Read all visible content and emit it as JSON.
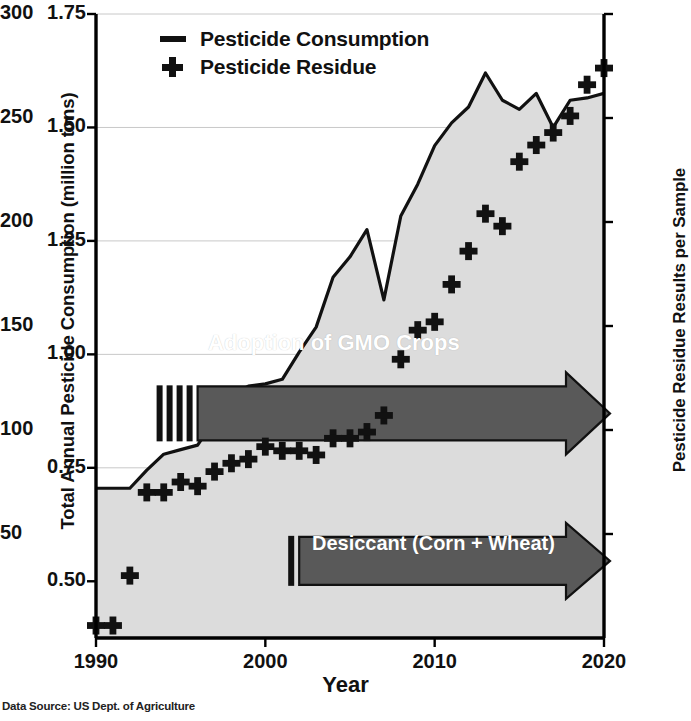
{
  "chart_data": {
    "type": "line",
    "title": "",
    "xlabel": "Year",
    "ylabel": "Total Annual Pesticide Consumption (million tons)",
    "ylabel_right": "Pesticide Residue Results per Sample",
    "xlim": [
      1990,
      2020
    ],
    "ylim": [
      0.375,
      1.75
    ],
    "ylim_right": [
      0,
      300
    ],
    "xticks": [
      "1990",
      "2000",
      "2010",
      "2020"
    ],
    "yticks_left": [
      "0.50",
      "0.75",
      "1.00",
      "1.25",
      "1.50",
      "1.75"
    ],
    "yticks_right": [
      "50",
      "100",
      "150",
      "200",
      "250",
      "300"
    ],
    "grid": true,
    "legend_position": "top-left",
    "source_note": "Data Source: US Dept. of Agriculture",
    "series": [
      {
        "name": "Pesticide Consumption",
        "type": "area-line",
        "axis": "left",
        "unit": "million tons",
        "x": [
          1990,
          1991,
          1992,
          1993,
          1994,
          1995,
          1996,
          1997,
          1998,
          1999,
          2000,
          2001,
          2002,
          2003,
          2004,
          2005,
          2006,
          2007,
          2008,
          2009,
          2010,
          2011,
          2012,
          2013,
          2014,
          2015,
          2016,
          2017,
          2018,
          2019,
          2020
        ],
        "values": [
          0.705,
          0.705,
          0.705,
          0.745,
          0.78,
          0.79,
          0.8,
          0.855,
          0.91,
          0.93,
          0.935,
          0.945,
          1.005,
          1.06,
          1.17,
          1.215,
          1.275,
          1.12,
          1.305,
          1.375,
          1.46,
          1.51,
          1.545,
          1.62,
          1.56,
          1.54,
          1.575,
          1.5,
          1.56,
          1.565,
          1.575
        ]
      },
      {
        "name": "Pesticide Residue",
        "type": "scatter",
        "axis": "right",
        "unit": "results per sample",
        "x": [
          1990,
          1991,
          1992,
          1993,
          1994,
          1995,
          1996,
          1997,
          1998,
          1999,
          2000,
          2001,
          2002,
          2003,
          2004,
          2005,
          2006,
          2007,
          2008,
          2009,
          2010,
          2011,
          2012,
          2013,
          2014,
          2015,
          2016,
          2017,
          2018,
          2019,
          2020
        ],
        "values": [
          6,
          6,
          30,
          70,
          70,
          75,
          73,
          80,
          84,
          86,
          92,
          90,
          90,
          88,
          96,
          96,
          99,
          107,
          134,
          148,
          152,
          170,
          186,
          204,
          198,
          229,
          237,
          243,
          251,
          266,
          274
        ]
      }
    ],
    "annotations": [
      {
        "id": "gmo",
        "label": "Adoption of GMO Crops",
        "shape": "right-arrow",
        "start_year": 1996,
        "end_year": 2020,
        "y_left": 0.87,
        "color": "#595959",
        "text_color": "#ffffff",
        "tick_bars": 4
      },
      {
        "id": "desiccant",
        "label": "Desiccant (Corn + Wheat)",
        "shape": "right-arrow",
        "start_year": 2002,
        "end_year": 2020,
        "y_left": 0.545,
        "color": "#595959",
        "text_color": "#ffffff",
        "tick_bars": 1
      }
    ],
    "colors": {
      "line": "#111111",
      "area_fill": "#dcdcdc",
      "marker": "#111111",
      "grid": "#c8c8c8",
      "axis": "#000000",
      "annotation": "#595959"
    }
  },
  "legend": {
    "items": [
      {
        "label": "Pesticide Consumption",
        "marker": "line-swatch"
      },
      {
        "label": "Pesticide Residue",
        "marker": "plus-swatch"
      }
    ]
  },
  "axes": {
    "x_title": "Year",
    "y_left_title": "Total Annual Pesticide Consumption (million tons)",
    "y_right_title": "Pesticide Residue Results per Sample"
  },
  "footer": {
    "source": "Data Source: US Dept. of Agriculture"
  }
}
